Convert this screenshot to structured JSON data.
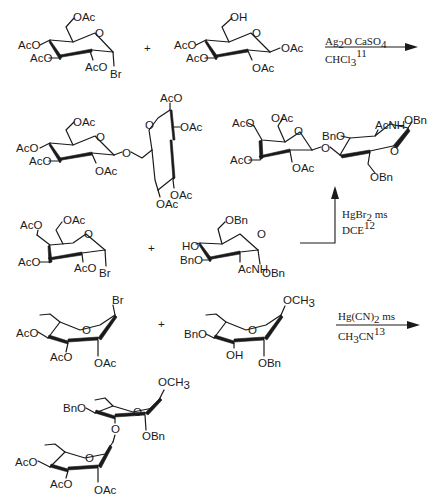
{
  "scheme": {
    "rows": [
      {
        "id": "reaction-1",
        "donor": {
          "name": "2,3,4,6-tetra-O-acetyl-glucopyranosyl bromide",
          "labels": [
            "OAc",
            "AcO",
            "AcO",
            "AcO",
            "Br",
            "O"
          ]
        },
        "plus": "+",
        "acceptor": {
          "name": "1,2,3,4-tetra-O-acetyl-glucopyranose (6-OH)",
          "labels": [
            "OH",
            "AcO",
            "AcO",
            "OAc",
            "OAc",
            "O"
          ]
        },
        "conditions": {
          "top": "Ag2O  CaSO4",
          "top_parts": [
            "Ag",
            "2",
            "O  CaSO",
            "4"
          ],
          "bottom": "CHCl3 11",
          "bottom_parts": [
            "CHCl",
            "3",
            "11"
          ]
        },
        "product": {
          "name": "1-6 linked disaccharide (peracetylated)",
          "labels": [
            "OAc",
            "AcO",
            "AcO",
            "OAc",
            "O",
            "O",
            "AcO",
            "O",
            "OAc",
            "OAc",
            "OAc"
          ]
        }
      },
      {
        "id": "reaction-2",
        "donor": {
          "name": "2,3,4,6-tetra-O-acetyl-galactopyranosyl bromide",
          "labels": [
            "AcO",
            "OAc",
            "AcO",
            "AcO",
            "Br",
            "O"
          ]
        },
        "plus": "+",
        "acceptor": {
          "name": "benzyl 2-acetamido-3,6-di-O-benzyl glucoside (4-OH)",
          "labels": [
            "OBn",
            "HO",
            "BnO",
            "AcNH",
            "OBn",
            "O"
          ]
        },
        "conditions": {
          "top": "HgBr2  ms",
          "top_parts": [
            "HgBr",
            "2",
            "  ms"
          ],
          "bottom": "DCE 12",
          "bottom_parts": [
            "DCE",
            "12"
          ]
        },
        "product": {
          "name": "Gal-(1-4)-GlcNAc disaccharide",
          "labels": [
            "AcO",
            "OAc",
            "AcO",
            "O",
            "OAc",
            "O",
            "BnO",
            "AcNH",
            "OBn",
            "O",
            "OBn"
          ]
        }
      },
      {
        "id": "reaction-3",
        "donor": {
          "name": "tri-O-acetyl-rhamnopyranosyl bromide",
          "labels": [
            "Br",
            "AcO",
            "O",
            "AcO",
            "OAc"
          ]
        },
        "plus": "+",
        "acceptor": {
          "name": "methyl 2,4-di-O-benzyl-rhamnopyranoside (3-OH)",
          "labels": [
            "OCH3",
            "BnO",
            "O",
            "OH",
            "OBn"
          ]
        },
        "conditions": {
          "top": "Hg(CN)2  ms",
          "top_parts": [
            "Hg(CN)",
            "2",
            "  ms"
          ],
          "bottom": "CH3CN 13",
          "bottom_parts": [
            "CH",
            "3",
            "CN",
            "13"
          ]
        },
        "product": {
          "name": "Rha-(1-3)-Rha disaccharide",
          "labels": [
            "OCH3",
            "BnO",
            "O",
            "O",
            "OBn",
            "AcO",
            "O",
            "AcO",
            "OAc"
          ]
        }
      }
    ]
  }
}
